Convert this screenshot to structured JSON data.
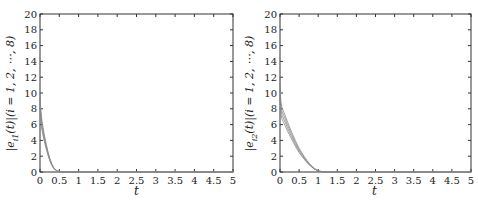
{
  "chart_data": [
    {
      "type": "line",
      "title": "",
      "xlabel": "t",
      "ylabel": "|e_{i1}(t)| (i = 1,2,⋯,8)",
      "xlim": [
        0,
        5
      ],
      "ylim": [
        0,
        20
      ],
      "x_ticks": [
        "0",
        "0.5",
        "1",
        "1.5",
        "2",
        "2.5",
        "3",
        "3.5",
        "4",
        "4.5",
        "5"
      ],
      "y_ticks": [
        "0",
        "2",
        "4",
        "6",
        "8",
        "10",
        "12",
        "14",
        "16",
        "18",
        "20"
      ],
      "grid": false,
      "legend": null,
      "series": [
        {
          "name": "|e_i1(t)| (bundle of 8 curves)",
          "color": "#888888",
          "x": [
            0,
            0.02,
            0.05,
            0.1,
            0.15,
            0.2,
            0.25,
            0.3,
            0.35,
            0.4,
            0.45,
            0.5,
            0.6,
            5
          ],
          "y": [
            10,
            8,
            6.5,
            5,
            3.8,
            2.7,
            1.8,
            1.1,
            0.6,
            0.3,
            0.12,
            0.05,
            0,
            0
          ]
        }
      ]
    },
    {
      "type": "line",
      "title": "",
      "xlabel": "t",
      "ylabel": "|e_{i2}(t)| (i = 1,2,⋯,8)",
      "xlim": [
        0,
        5
      ],
      "ylim": [
        0,
        20
      ],
      "x_ticks": [
        "0",
        "0.5",
        "1",
        "1.5",
        "2",
        "2.5",
        "3",
        "3.5",
        "4",
        "4.5",
        "5"
      ],
      "y_ticks": [
        "0",
        "2",
        "4",
        "6",
        "8",
        "10",
        "12",
        "14",
        "16",
        "18",
        "20"
      ],
      "grid": false,
      "legend": null,
      "series": [
        {
          "name": "|e_i2(t)| (bundle of 8 curves)",
          "color": "#888888",
          "x": [
            0,
            0.02,
            0.05,
            0.1,
            0.2,
            0.3,
            0.4,
            0.5,
            0.6,
            0.7,
            0.8,
            0.9,
            1.0,
            1.1,
            1.2,
            5
          ],
          "y": [
            12,
            9,
            8.2,
            7.6,
            6.3,
            5.1,
            4.0,
            3.0,
            2.2,
            1.5,
            0.9,
            0.45,
            0.15,
            0.04,
            0,
            0
          ]
        }
      ]
    }
  ],
  "panels": [
    {
      "ylabel_main": "|e",
      "ylabel_sub": "i1",
      "ylabel_rest": "(t)|(i = 1, 2, ⋯, 8)",
      "xlabel": "t"
    },
    {
      "ylabel_main": "|e",
      "ylabel_sub": "i2",
      "ylabel_rest": "(t)|(i = 1, 2, ⋯, 8)",
      "xlabel": "t"
    }
  ]
}
